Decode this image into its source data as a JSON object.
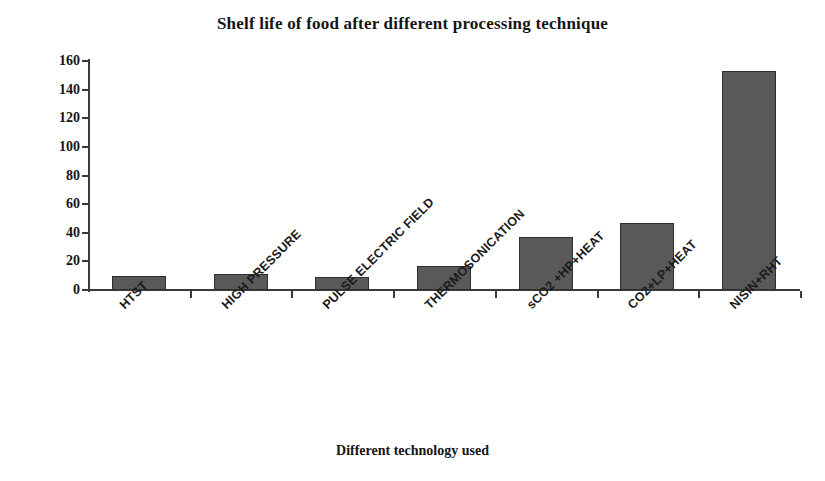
{
  "chart_data": {
    "type": "bar",
    "title": "Shelf life of food after different processing technique",
    "xlabel": "Different technology used",
    "ylabel": "No. of days",
    "categories": [
      "HTST",
      "HIGH PRESSURE",
      "PULSE ELECTRIC FIELD",
      "THERMOSONICATION",
      "sCO2 +HP+HEAT",
      "CO2+LP+HEAT",
      "NISIN+RHT"
    ],
    "values": [
      10,
      11,
      9,
      17,
      37,
      47,
      153
    ],
    "ylim": [
      0,
      160
    ],
    "yticks": [
      0,
      20,
      40,
      60,
      80,
      100,
      120,
      140,
      160
    ],
    "grid": false,
    "legend": false,
    "bar_color": "#595959",
    "axis_color": "#3a3a3a",
    "text_color": "#151515"
  }
}
